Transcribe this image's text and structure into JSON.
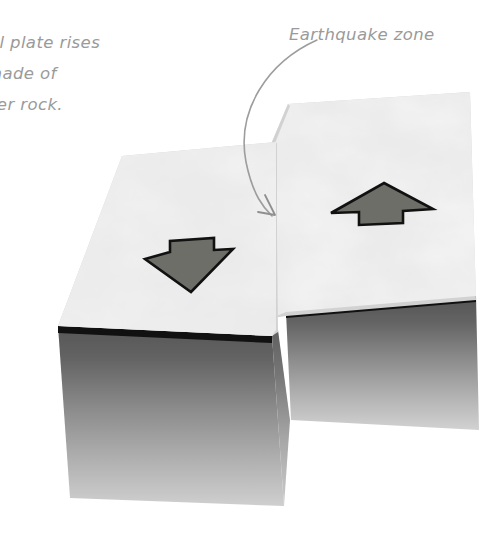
{
  "figure": {
    "background_color": "#ffffff"
  },
  "labels": {
    "left_caption": {
      "name": "left-caption",
      "lines": [
        "tal plate rises",
        "made of",
        "ter rock."
      ],
      "color": "#9a9a9a",
      "clipped_at_left_edge": true
    },
    "right_caption": {
      "name": "earthquake-zone-label",
      "text": "Earthquake zone",
      "color": "#9a9a9a"
    }
  },
  "leader_arrow": {
    "name": "earthquake-zone-leader-arrow",
    "color": "#9d9d9d",
    "points_to": "fault line between blocks",
    "tip_x": 272,
    "tip_y": 216
  },
  "blocks": [
    {
      "name": "left-block",
      "label": "downthrown block",
      "top_surface_color": "#d2d2d2",
      "front_face_top_color": "#5a5a5a",
      "front_face_bottom_color": "#c9c9c9",
      "edge_color": "#111111",
      "motion": "down"
    },
    {
      "name": "right-block",
      "label": "upthrown block",
      "top_surface_color": "#d2d2d2",
      "front_face_top_color": "#5a5a5a",
      "front_face_bottom_color": "#c9c9c9",
      "edge_color": "#111111",
      "motion": "up"
    }
  ],
  "motion_arrows": [
    {
      "name": "down-arrow",
      "direction": "down",
      "fill_color": "#6e6e68",
      "stroke_color": "#111111",
      "on_block": "left-block"
    },
    {
      "name": "up-arrow",
      "direction": "up",
      "fill_color": "#6e6e68",
      "stroke_color": "#111111",
      "on_block": "right-block"
    }
  ]
}
